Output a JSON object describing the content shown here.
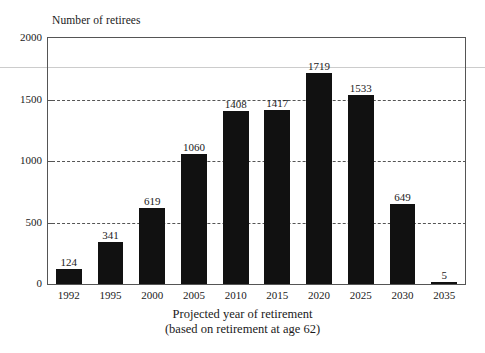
{
  "chart_data": {
    "type": "bar",
    "title": "",
    "ylabel": "Number of retirees",
    "xlabel": "Projected year of retirement",
    "xlabel_sub": "(based on retirement at age 62)",
    "categories": [
      "1992",
      "1995",
      "2000",
      "2005",
      "2010",
      "2015",
      "2020",
      "2025",
      "2030",
      "2035"
    ],
    "values": [
      124,
      341,
      619,
      1060,
      1408,
      1417,
      1719,
      1533,
      649,
      5
    ],
    "value_labels": [
      "124",
      "341",
      "619",
      "1060",
      "1408",
      "1417",
      "1719",
      "1533",
      "649",
      "5"
    ],
    "ylim": [
      0,
      2000
    ],
    "yticks": [
      0,
      500,
      1000,
      1500,
      2000
    ],
    "ytick_labels": [
      "0",
      "500",
      "1000",
      "1500",
      "2000"
    ],
    "gridlines": [
      500,
      1000,
      1500
    ],
    "grid": "horizontal-dashed",
    "legend": "none",
    "bar_color": "#111111",
    "frame_color": "#555555",
    "background": "#ffffff"
  }
}
